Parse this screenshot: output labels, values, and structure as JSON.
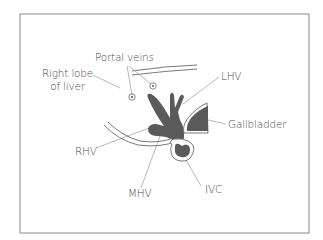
{
  "figure": {
    "type": "anatomical-diagram",
    "frame_color": "#8a8a8a",
    "fill_color": "#5a5a5a",
    "line_color": "#6a6a6a",
    "leader_color": "#9a9a9a",
    "text_color": "#4a4a4a"
  },
  "labels": {
    "portal_veins": "Portal veins",
    "right_lobe_line1": "Right lobe",
    "right_lobe_line2": "of liver",
    "lhv": "LHV",
    "gallbladder": "Gallbladder",
    "rhv": "RHV",
    "mhv": "MHV",
    "ivc": "IVC"
  },
  "structures": [
    {
      "id": "portal-vein-1",
      "label": "Portal veins"
    },
    {
      "id": "portal-vein-2",
      "label": "Portal veins"
    },
    {
      "id": "hepatic-veins",
      "labels": [
        "LHV",
        "MHV",
        "RHV"
      ]
    },
    {
      "id": "gallbladder",
      "label": "Gallbladder"
    },
    {
      "id": "ivc",
      "label": "IVC"
    },
    {
      "id": "liver-right-lobe",
      "label": "Right lobe of liver"
    }
  ]
}
